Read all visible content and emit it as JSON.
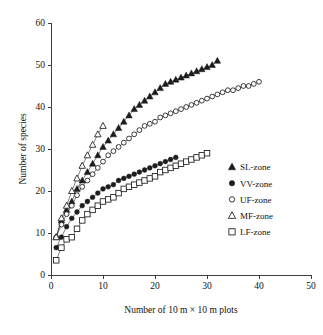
{
  "chart_data": {
    "type": "line",
    "title": "",
    "xlabel": "Number of 10 m × 10 m plots",
    "ylabel": "Number of species",
    "xlim": [
      0,
      50
    ],
    "ylim": [
      0,
      60
    ],
    "xticks": [
      0,
      10,
      20,
      30,
      40,
      50
    ],
    "yticks": [
      0,
      10,
      20,
      30,
      40,
      50,
      60
    ],
    "grid": false,
    "legend_position": "right-middle",
    "series": [
      {
        "name": "SL-zone",
        "marker": "filled-triangle",
        "x": [
          1,
          2,
          3,
          4,
          5,
          6,
          7,
          8,
          9,
          10,
          11,
          12,
          13,
          14,
          15,
          16,
          17,
          18,
          19,
          20,
          21,
          22,
          23,
          24,
          25,
          26,
          27,
          28,
          29,
          30,
          31,
          32
        ],
        "y": [
          9.0,
          13.0,
          15.5,
          17.5,
          20.5,
          22.5,
          24.5,
          26.5,
          28.5,
          30.5,
          32.0,
          33.5,
          35.0,
          36.5,
          38.0,
          39.5,
          40.5,
          41.5,
          42.5,
          43.5,
          44.5,
          45.5,
          46.0,
          46.5,
          47.0,
          47.5,
          48.0,
          48.5,
          49.0,
          49.5,
          50.0,
          51.0
        ]
      },
      {
        "name": "VV-zone",
        "marker": "filled-circle",
        "x": [
          1,
          2,
          3,
          4,
          5,
          6,
          7,
          8,
          9,
          10,
          11,
          12,
          13,
          14,
          15,
          16,
          17,
          18,
          19,
          20,
          21,
          22,
          23,
          24
        ],
        "y": [
          6.5,
          9.0,
          11.5,
          13.5,
          15.0,
          16.5,
          17.5,
          18.5,
          19.5,
          20.5,
          21.0,
          21.5,
          22.5,
          23.0,
          23.5,
          24.0,
          24.5,
          25.0,
          25.5,
          26.0,
          26.5,
          27.0,
          27.5,
          28.0
        ]
      },
      {
        "name": "UF-zone",
        "marker": "open-circle",
        "x": [
          1,
          2,
          3,
          4,
          5,
          6,
          7,
          8,
          9,
          10,
          11,
          12,
          13,
          14,
          15,
          16,
          17,
          18,
          19,
          20,
          21,
          22,
          23,
          24,
          25,
          26,
          27,
          28,
          29,
          30,
          31,
          32,
          33,
          34,
          35,
          36,
          37,
          38,
          39,
          40
        ],
        "y": [
          9.0,
          12.0,
          14.5,
          16.5,
          19.0,
          21.0,
          22.5,
          24.0,
          25.5,
          27.0,
          28.5,
          29.5,
          30.5,
          31.5,
          32.5,
          33.5,
          34.5,
          35.5,
          36.0,
          36.5,
          37.5,
          38.0,
          38.5,
          39.0,
          39.5,
          40.0,
          40.5,
          41.0,
          41.5,
          42.0,
          42.5,
          43.0,
          43.5,
          44.0,
          44.0,
          44.5,
          45.0,
          45.0,
          45.5,
          46.0
        ]
      },
      {
        "name": "MF-zone",
        "marker": "open-triangle",
        "x": [
          1,
          2,
          3,
          4,
          5,
          6,
          7,
          8,
          9,
          10
        ],
        "y": [
          9.0,
          13.5,
          16.5,
          20.0,
          23.0,
          26.0,
          28.5,
          31.0,
          33.5,
          35.5
        ]
      },
      {
        "name": "LF-zone",
        "marker": "open-square",
        "x": [
          1,
          2,
          3,
          4,
          5,
          6,
          7,
          8,
          9,
          10,
          11,
          12,
          13,
          14,
          15,
          16,
          17,
          18,
          19,
          20,
          21,
          22,
          23,
          24,
          25,
          26,
          27,
          28,
          29,
          30
        ],
        "y": [
          3.5,
          6.5,
          8.5,
          9.0,
          11.0,
          13.0,
          14.5,
          15.5,
          16.5,
          17.5,
          18.0,
          18.5,
          19.5,
          20.5,
          21.0,
          21.5,
          22.0,
          22.5,
          23.0,
          23.5,
          24.5,
          25.0,
          25.5,
          26.0,
          26.5,
          27.0,
          27.5,
          28.0,
          28.5,
          29.0
        ]
      }
    ]
  },
  "legend": {
    "entries": [
      {
        "label": "SL-zone",
        "marker": "filled-triangle"
      },
      {
        "label": "VV-zone",
        "marker": "filled-circle"
      },
      {
        "label": "UF-zone",
        "marker": "open-circle"
      },
      {
        "label": "MF-zone",
        "marker": "open-triangle"
      },
      {
        "label": "LF-zone",
        "marker": "open-square"
      }
    ]
  },
  "colors": {
    "ink": "#1c1c1c",
    "axis": "#2b2b2b",
    "background": "#ffffff"
  }
}
